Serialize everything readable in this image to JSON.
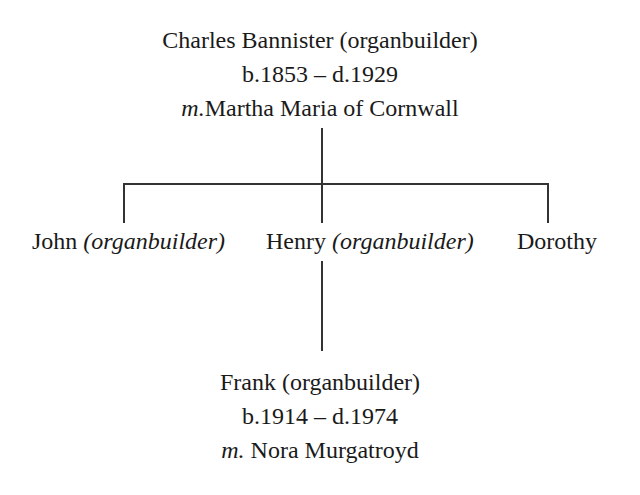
{
  "root": {
    "name": "Charles Bannister",
    "role": "(organbuilder)",
    "dates": "b.1853 – d.1929",
    "marriage_prefix": "m.",
    "spouse": "Martha Maria of Cornwall"
  },
  "children": [
    {
      "name": "John",
      "role": "(organbuilder)"
    },
    {
      "name": "Henry",
      "role": "(organbuilder)"
    },
    {
      "name": "Dorothy",
      "role": ""
    }
  ],
  "grandchild": {
    "name": "Frank",
    "role": "(organbuilder)",
    "dates": "b.1914 – d.1974",
    "marriage_prefix": "m.",
    "spouse": " Nora Murgatroyd"
  },
  "colors": {
    "text": "#1a1a1a",
    "lines": "#333333",
    "background": "#ffffff"
  }
}
